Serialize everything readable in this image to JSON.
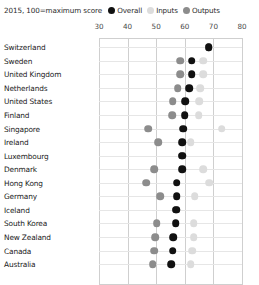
{
  "header": {
    "subtitle": "2015, 100=maximum score"
  },
  "legend": {
    "position": "top-right",
    "items": [
      {
        "label": "Overall",
        "color": "#111111",
        "key": "overall"
      },
      {
        "label": "Inputs",
        "color": "#dcdcdc",
        "key": "inputs"
      },
      {
        "label": "Outputs",
        "color": "#8c8c8c",
        "key": "outputs"
      }
    ]
  },
  "axis": {
    "ticks": [
      30,
      40,
      50,
      60,
      70,
      80
    ],
    "tick_labels": [
      "30",
      "40",
      "50",
      "60",
      "70",
      "80"
    ],
    "min": 30,
    "max": 80
  },
  "chart_data": {
    "type": "scatter",
    "title": "",
    "subtitle": "2015, 100=maximum score",
    "xlabel": "",
    "ylabel": "",
    "xlim": [
      30,
      80
    ],
    "grid": true,
    "orientation": "horizontal",
    "legend_position": "top-right",
    "categories": [
      "Switzerland",
      "Sweden",
      "United Kingdom",
      "Netherlands",
      "United States",
      "Finland",
      "Singapore",
      "Ireland",
      "Luxembourg",
      "Denmark",
      "Hong Kong",
      "Germany",
      "Iceland",
      "South Korea",
      "New Zealand",
      "Canada",
      "Australia"
    ],
    "series": [
      {
        "name": "Overall",
        "key": "overall",
        "color": "#111111",
        "values": [
          68.3,
          62.4,
          62.4,
          61.6,
          60.1,
          60.0,
          59.4,
          59.1,
          59.0,
          59.0,
          57.2,
          57.1,
          57.0,
          56.8,
          55.9,
          55.7,
          55.2
        ]
      },
      {
        "name": "Inputs",
        "key": "inputs",
        "color": "#dcdcdc",
        "values": [
          68.3,
          66.5,
          66.5,
          65.4,
          65.1,
          64.9,
          72.9,
          62.0,
          59.0,
          66.5,
          68.6,
          63.5,
          57.0,
          63.1,
          63.1,
          62.6,
          62.1
        ]
      },
      {
        "name": "Outputs",
        "key": "outputs",
        "color": "#8c8c8c",
        "values": [
          68.3,
          58.3,
          58.3,
          57.5,
          55.7,
          55.5,
          47.2,
          50.8,
          59.0,
          49.3,
          46.5,
          51.4,
          57.0,
          50.2,
          49.6,
          49.3,
          48.8
        ]
      }
    ]
  }
}
